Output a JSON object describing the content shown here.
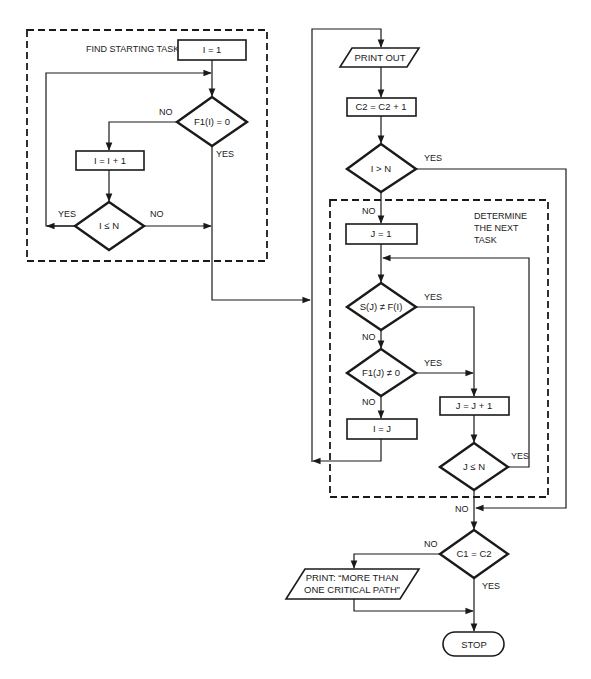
{
  "groups": {
    "find_starting_task": "FIND STARTING TASK",
    "determine_next_task": [
      "DETERMINE",
      "THE NEXT",
      "TASK"
    ]
  },
  "nodes": {
    "i_eq_1": "I = 1",
    "f1_i_eq_0": "F1(I) = 0",
    "i_eq_i_plus_1": "I = I + 1",
    "i_le_n_1": "I ≤ N",
    "print_out": "PRINT OUT",
    "c2_inc": "C2 = C2 + 1",
    "i_gt_n": "I > N",
    "j_eq_1": "J = 1",
    "s_j_ne_f_i": "S(J) ≠ F(I)",
    "f1_j_ne_0": "F1(J) ≠ 0",
    "i_eq_j": "I = J",
    "j_eq_j_plus_1": "J = J + 1",
    "j_le_n": "J ≤ N",
    "c1_eq_c2": "C1 = C2",
    "print_msg_line1": "PRINT: “MORE THAN",
    "print_msg_line2": "ONE CRITICAL PATH”",
    "stop": "STOP"
  },
  "edge_labels": {
    "yes": "YES",
    "no": "NO"
  }
}
